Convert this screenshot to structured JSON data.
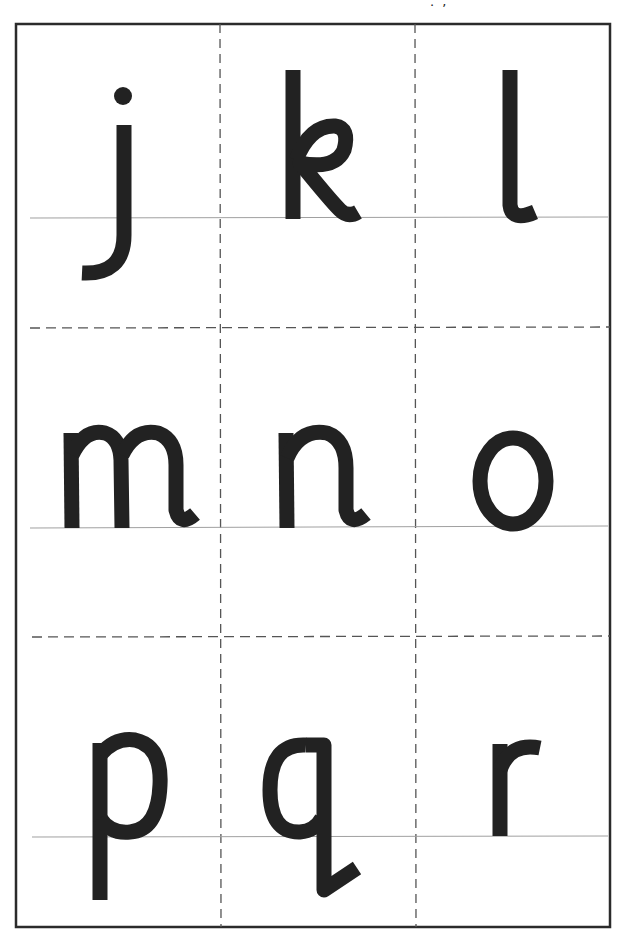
{
  "page": {
    "top_clipped_text": ".   ,"
  },
  "grid": {
    "rows": 3,
    "columns": 3,
    "border_color": "#2b2b2b",
    "dash_color": "#555555",
    "baseline_color": "#a0a0a0",
    "letter_color": "#222222"
  },
  "cards": [
    {
      "letter": "j",
      "row": 1,
      "col": 1
    },
    {
      "letter": "k",
      "row": 1,
      "col": 2
    },
    {
      "letter": "l",
      "row": 1,
      "col": 3
    },
    {
      "letter": "m",
      "row": 2,
      "col": 1
    },
    {
      "letter": "n",
      "row": 2,
      "col": 2
    },
    {
      "letter": "o",
      "row": 2,
      "col": 3
    },
    {
      "letter": "p",
      "row": 3,
      "col": 1
    },
    {
      "letter": "q",
      "row": 3,
      "col": 2
    },
    {
      "letter": "r",
      "row": 3,
      "col": 3
    }
  ]
}
